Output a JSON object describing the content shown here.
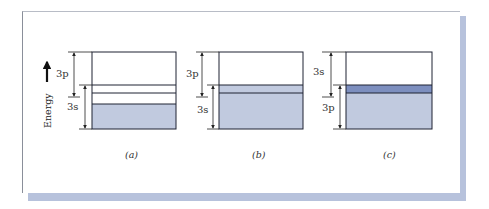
{
  "figure": {
    "axis_label": "Energy",
    "colors": {
      "filled_band": "#c1cadf",
      "overlap_band": "#7d8fbf",
      "outline": "#1e2233",
      "shadow": "#b7c2dc"
    },
    "panels": [
      {
        "caption": "(a)",
        "upper_label": "3p",
        "lower_label": "3s",
        "description": "3p and 3s bands separated by a gap; lower part of 3s filled"
      },
      {
        "caption": "(b)",
        "upper_label": "3p",
        "lower_label": "3s",
        "description": "3p and 3s bands overlap; filled up through overlap region"
      },
      {
        "caption": "(c)",
        "upper_label": "3s",
        "lower_label": "3p",
        "description": "3s and 3p bands overlap; overlap region shaded darker, filled below"
      }
    ]
  }
}
